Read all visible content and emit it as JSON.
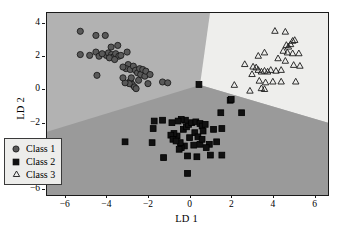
{
  "chart_data": {
    "type": "scatter",
    "title": "",
    "xlabel": "LD 1",
    "ylabel": "LD 2",
    "xlim": [
      -6.9,
      6.6
    ],
    "ylim": [
      -6.3,
      4.65
    ],
    "xticks": [
      -6,
      -4,
      -2,
      0,
      2,
      4,
      6
    ],
    "yticks": [
      4,
      2,
      0,
      -2,
      -4,
      -6
    ],
    "xtick_labels": [
      "−6",
      "−4",
      "−2",
      "0",
      "2",
      "4",
      "6"
    ],
    "ytick_labels": [
      "4",
      "2",
      "0",
      "−2",
      "−4",
      "−6"
    ],
    "grid": false,
    "legend_position": "lower-left",
    "decision_regions": {
      "description": "Three LDA decision regions meeting at a triple point",
      "triple_point": [
        0.45,
        0.32
      ],
      "class1_region_color": "#b2b2b2",
      "class2_region_color": "#9a9a9a",
      "class3_region_color": "#eeeeec",
      "boundary_class1_class2": [
        [
          -6.9,
          -2.5
        ],
        [
          0.45,
          0.32
        ]
      ],
      "boundary_class2_class3": [
        [
          0.45,
          0.32
        ],
        [
          6.6,
          -1.95
        ]
      ],
      "boundary_class1_class3": [
        [
          0.45,
          0.32
        ],
        [
          0.93,
          4.65
        ]
      ]
    },
    "series": [
      {
        "name": "Class 1",
        "marker": "circle",
        "marker_fill": "#595959",
        "marker_edge": "#141414",
        "points": [
          [
            -5.3,
            3.55
          ],
          [
            -4.55,
            3.3
          ],
          [
            -4.1,
            3.3
          ],
          [
            -5.3,
            2.15
          ],
          [
            -4.55,
            2.3
          ],
          [
            -4.05,
            2.1
          ],
          [
            -3.95,
            2.25
          ],
          [
            -3.8,
            2.15
          ],
          [
            -3.72,
            2.0
          ],
          [
            -3.6,
            2.2
          ],
          [
            -3.45,
            2.05
          ],
          [
            -4.85,
            2.1
          ],
          [
            -4.4,
            2.05
          ],
          [
            -3.5,
            2.7
          ],
          [
            -3.82,
            2.6
          ],
          [
            -3.05,
            2.3
          ],
          [
            -3.0,
            1.55
          ],
          [
            -3.1,
            1.3
          ],
          [
            -3.25,
            1.4
          ],
          [
            -2.9,
            1.25
          ],
          [
            -2.75,
            1.45
          ],
          [
            -2.65,
            1.2
          ],
          [
            -2.55,
            1.05
          ],
          [
            -2.45,
            1.3
          ],
          [
            -2.4,
            0.95
          ],
          [
            -2.3,
            1.25
          ],
          [
            -2.2,
            0.85
          ],
          [
            -2.9,
            0.55
          ],
          [
            -2.8,
            0.35
          ],
          [
            -2.7,
            0.2
          ],
          [
            -2.62,
            0.1
          ],
          [
            -2.95,
            0.4
          ],
          [
            -3.15,
            0.45
          ],
          [
            -4.5,
            0.9
          ],
          [
            -3.25,
            0.75
          ],
          [
            -2.15,
            1.15
          ],
          [
            -1.95,
            0.95
          ],
          [
            -1.35,
            0.5
          ],
          [
            -1.1,
            0.45
          ],
          [
            -2.05,
            0.4
          ],
          [
            -3.9,
            1.95
          ],
          [
            -3.65,
            1.85
          ],
          [
            -4.25,
            2.2
          ],
          [
            -3.35,
            2.1
          ],
          [
            -2.85,
            0.75
          ],
          [
            -2.5,
            0.6
          ]
        ]
      },
      {
        "name": "Class 2",
        "marker": "square",
        "marker_fill": "#111111",
        "marker_edge": "#000000",
        "points": [
          [
            0.4,
            0.35
          ],
          [
            1.9,
            -0.6
          ],
          [
            1.95,
            -0.55
          ],
          [
            1.45,
            -1.35
          ],
          [
            2.45,
            -1.35
          ],
          [
            1.5,
            -2.3
          ],
          [
            1.25,
            -3.1
          ],
          [
            1.5,
            -3.9
          ],
          [
            0.9,
            -3.25
          ],
          [
            0.45,
            -3.25
          ],
          [
            0.15,
            -3.3
          ],
          [
            -0.3,
            -3.35
          ],
          [
            -0.45,
            -3.45
          ],
          [
            -0.55,
            -3.55
          ],
          [
            -0.5,
            -3.15
          ],
          [
            -0.65,
            -2.75
          ],
          [
            -0.8,
            -2.6
          ],
          [
            -0.95,
            -2.7
          ],
          [
            -0.85,
            -2.95
          ],
          [
            -0.7,
            -3.05
          ],
          [
            -0.35,
            -2.35
          ],
          [
            -0.2,
            -2.2
          ],
          [
            -0.1,
            -2.05
          ],
          [
            0.05,
            -1.95
          ],
          [
            0.25,
            -1.9
          ],
          [
            0.45,
            -2.0
          ],
          [
            0.55,
            -2.15
          ],
          [
            0.7,
            -2.05
          ],
          [
            -0.25,
            -1.8
          ],
          [
            -0.45,
            -1.75
          ],
          [
            -0.6,
            -1.85
          ],
          [
            -0.9,
            -1.95
          ],
          [
            -1.35,
            -1.8
          ],
          [
            -1.75,
            -1.85
          ],
          [
            -1.8,
            -2.3
          ],
          [
            -1.85,
            -3.15
          ],
          [
            -3.15,
            -3.1
          ],
          [
            -1.3,
            -4.05
          ],
          [
            -0.15,
            -5.0
          ],
          [
            0.2,
            -2.55
          ],
          [
            0.35,
            -2.8
          ],
          [
            0.55,
            -2.95
          ],
          [
            0.75,
            -3.45
          ],
          [
            0.95,
            -3.9
          ],
          [
            1.1,
            -2.35
          ],
          [
            -0.15,
            -3.95
          ],
          [
            0.3,
            -4.0
          ],
          [
            0.6,
            -2.45
          ],
          [
            -0.05,
            -2.85
          ]
        ]
      },
      {
        "name": "Class 3",
        "marker": "triangle",
        "marker_fill": "none",
        "marker_edge": "#1a1a1a",
        "points": [
          [
            4.05,
            3.55
          ],
          [
            4.55,
            3.5
          ],
          [
            4.6,
            2.7
          ],
          [
            4.7,
            2.6
          ],
          [
            4.8,
            2.75
          ],
          [
            4.9,
            2.95
          ],
          [
            5.0,
            3.0
          ],
          [
            4.45,
            2.35
          ],
          [
            4.65,
            2.25
          ],
          [
            4.9,
            2.2
          ],
          [
            5.2,
            2.2
          ],
          [
            5.25,
            1.45
          ],
          [
            4.95,
            1.5
          ],
          [
            4.55,
            1.75
          ],
          [
            4.2,
            1.9
          ],
          [
            3.85,
            1.2
          ],
          [
            3.7,
            1.1
          ],
          [
            3.55,
            1.15
          ],
          [
            3.4,
            1.1
          ],
          [
            3.25,
            1.2
          ],
          [
            3.15,
            1.35
          ],
          [
            3.0,
            1.4
          ],
          [
            3.25,
            2.05
          ],
          [
            3.55,
            2.25
          ],
          [
            4.1,
            1.15
          ],
          [
            4.35,
            1.2
          ],
          [
            2.1,
            0.3
          ],
          [
            2.85,
            -0.05
          ],
          [
            3.4,
            0.1
          ],
          [
            3.55,
            0.05
          ],
          [
            3.6,
            0.45
          ],
          [
            3.95,
            0.5
          ],
          [
            4.35,
            0.5
          ],
          [
            5.05,
            0.5
          ],
          [
            2.6,
            1.55
          ],
          [
            2.95,
            0.95
          ],
          [
            3.3,
            0.55
          ]
        ]
      }
    ]
  },
  "legend": {
    "items": [
      {
        "label": "Class 1",
        "marker": "circle"
      },
      {
        "label": "Class 2",
        "marker": "square"
      },
      {
        "label": "Class 3",
        "marker": "triangle"
      }
    ]
  }
}
